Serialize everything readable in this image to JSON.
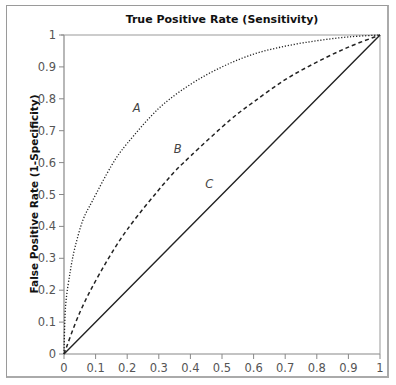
{
  "chart_data": {
    "type": "line",
    "title": "True Positive Rate (Sensitivity)",
    "xlabel": "",
    "ylabel": "False Positive Rate (1-Specificity)",
    "xlim": [
      0,
      1
    ],
    "ylim": [
      0,
      1
    ],
    "grid": false,
    "legend": "none (inline curve labels)",
    "x_ticks": [
      "0",
      "0.1",
      "0.2",
      "0.3",
      "0.4",
      "0.5",
      "0.6",
      "0.7",
      "0.8",
      "0.9",
      "1"
    ],
    "y_ticks": [
      "0",
      "0.1",
      "0.2",
      "0.3",
      "0.4",
      "0.5",
      "0.6",
      "0.7",
      "0.8",
      "0.9",
      "1"
    ],
    "series": [
      {
        "name": "A",
        "style": "dotted",
        "x": [
          0,
          0.005,
          0.02,
          0.035,
          0.06,
          0.09,
          0.15,
          0.2,
          0.3,
          0.4,
          0.5,
          0.6,
          0.7,
          0.8,
          0.9,
          1
        ],
        "y": [
          0,
          0.15,
          0.26,
          0.335,
          0.42,
          0.48,
          0.59,
          0.66,
          0.77,
          0.845,
          0.9,
          0.94,
          0.965,
          0.982,
          0.994,
          1
        ]
      },
      {
        "name": "B",
        "style": "dashed",
        "x": [
          0,
          0.05,
          0.114,
          0.2,
          0.326,
          0.4,
          0.525,
          0.6,
          0.7,
          0.8,
          0.9,
          1
        ],
        "y": [
          0,
          0.13,
          0.254,
          0.39,
          0.545,
          0.62,
          0.733,
          0.79,
          0.86,
          0.915,
          0.962,
          1
        ]
      },
      {
        "name": "C",
        "style": "solid",
        "x": [
          0,
          1
        ],
        "y": [
          0,
          1
        ]
      }
    ],
    "annotations": [
      {
        "text": "A",
        "x": 0.23,
        "y": 0.76
      },
      {
        "text": "B",
        "x": 0.36,
        "y": 0.63
      },
      {
        "text": "C",
        "x": 0.46,
        "y": 0.52
      }
    ]
  }
}
